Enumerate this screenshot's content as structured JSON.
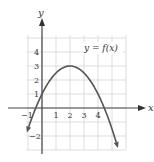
{
  "chart_data": {
    "type": "line",
    "title": "",
    "annotation": "y = f(x)",
    "xlabel": "x",
    "ylabel": "y",
    "xlim": [
      -1.1,
      6
    ],
    "ylim": [
      -3,
      5.2
    ],
    "grid": true,
    "x_ticks": [
      -1,
      1,
      2,
      3,
      4
    ],
    "x_tick_labels": [
      "−1",
      "1",
      "2",
      "3",
      "4"
    ],
    "y_ticks": [
      1,
      2,
      3,
      4,
      -2
    ],
    "y_tick_labels": [
      "1",
      "2",
      "3",
      "4",
      "−2"
    ],
    "series": [
      {
        "name": "y = f(x)",
        "formula": "f(x) = -0.5(x-2)^2 + 3",
        "vertex": [
          2,
          3
        ],
        "y_intercept": 1,
        "x": [
          -1,
          -0.5,
          0,
          0.5,
          1,
          1.5,
          2,
          2.5,
          3,
          3.5,
          4,
          4.5,
          5,
          5.4
        ],
        "y": [
          -1.5,
          -0.125,
          1,
          1.875,
          2.5,
          2.875,
          3,
          2.875,
          2.5,
          1.875,
          1,
          -0.125,
          -1.5,
          -2.78
        ],
        "color": "#555555",
        "arrows_at_ends": true
      }
    ]
  }
}
